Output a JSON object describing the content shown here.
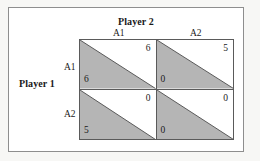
{
  "figure": {
    "type": "payoff-bimatrix",
    "column_player_title": "Player 2",
    "row_player_title": "Player 1",
    "column_labels": [
      "A1",
      "A2"
    ],
    "row_labels": [
      "A1",
      "A2"
    ],
    "colors": {
      "row_player_triangle_fill": "#b5b5b5",
      "column_player_triangle_fill": "#ffffff",
      "cell_border": "#5a5a5a",
      "frame_border": "#8e8e8e",
      "frame_background": "#ffffff",
      "page_background": "#f7f7f5",
      "text": "#1a1a1a"
    },
    "cells": [
      {
        "row": "A1",
        "column": "A1",
        "column_player_payoff": "6",
        "row_player_payoff": "6"
      },
      {
        "row": "A1",
        "column": "A2",
        "column_player_payoff": "5",
        "row_player_payoff": "0"
      },
      {
        "row": "A2",
        "column": "A1",
        "column_player_payoff": "0",
        "row_player_payoff": "5"
      },
      {
        "row": "A2",
        "column": "A2",
        "column_player_payoff": "0",
        "row_player_payoff": "0"
      }
    ]
  }
}
